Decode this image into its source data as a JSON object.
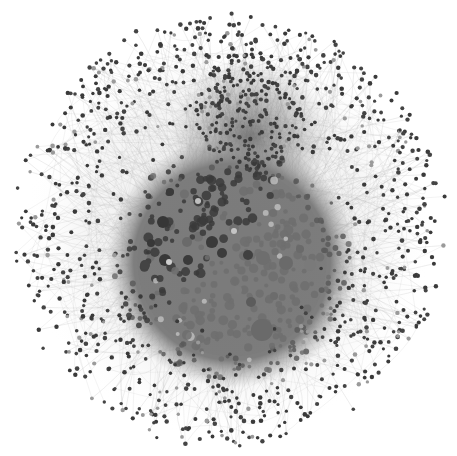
{
  "canvas": {
    "width": 457,
    "height": 456,
    "background": "#ffffff"
  },
  "graph": {
    "type": "force-directed network",
    "center": [
      228,
      230
    ],
    "outer_radius": 215,
    "core": {
      "center": [
        232,
        262
      ],
      "radius": 118,
      "fill": "#7a7a7a"
    },
    "dense_cluster": {
      "center": [
        250,
        110
      ],
      "radius": 55
    },
    "colors": {
      "node_dark": "#3a3a3a",
      "node_mid": "#5a5a5a",
      "node_core": "#6e6e6e",
      "node_light": "#bdbdbd",
      "edge": "#9a9a9a"
    },
    "halo_node_count": 900,
    "core_node_count": 420,
    "large_nodes": [
      {
        "x": 262,
        "y": 330,
        "r": 11,
        "fill": "#6a6a6a"
      },
      {
        "x": 263,
        "y": 258,
        "r": 7,
        "fill": "#6e6e6e"
      },
      {
        "x": 286,
        "y": 263,
        "r": 7,
        "fill": "#6a6a6a"
      },
      {
        "x": 310,
        "y": 265,
        "r": 6,
        "fill": "#7a7a7a"
      },
      {
        "x": 212,
        "y": 242,
        "r": 6,
        "fill": "#3a3a3a"
      },
      {
        "x": 222,
        "y": 253,
        "r": 5,
        "fill": "#3c3c3c"
      },
      {
        "x": 163,
        "y": 222,
        "r": 6,
        "fill": "#363636"
      },
      {
        "x": 165,
        "y": 260,
        "r": 6,
        "fill": "#383838"
      },
      {
        "x": 188,
        "y": 260,
        "r": 5,
        "fill": "#3a3a3a"
      },
      {
        "x": 248,
        "y": 255,
        "r": 5,
        "fill": "#404040"
      },
      {
        "x": 251,
        "y": 302,
        "r": 5,
        "fill": "#5c5c5c"
      },
      {
        "x": 187,
        "y": 242,
        "r": 5,
        "fill": "#6a6a6a"
      },
      {
        "x": 274,
        "y": 296,
        "r": 4,
        "fill": "#6c6c6c"
      },
      {
        "x": 238,
        "y": 290,
        "r": 4,
        "fill": "#7c7c7c"
      },
      {
        "x": 300,
        "y": 249,
        "r": 4,
        "fill": "#6a6a6a"
      },
      {
        "x": 145,
        "y": 265,
        "r": 5,
        "fill": "#444444"
      },
      {
        "x": 151,
        "y": 243,
        "r": 4,
        "fill": "#383838"
      },
      {
        "x": 170,
        "y": 192,
        "r": 4,
        "fill": "#3a3a3a"
      },
      {
        "x": 198,
        "y": 201,
        "r": 3,
        "fill": "#bfbfbf"
      },
      {
        "x": 234,
        "y": 231,
        "r": 3,
        "fill": "#c4c4c4"
      },
      {
        "x": 169,
        "y": 262,
        "r": 3,
        "fill": "#cfcfcf"
      }
    ]
  }
}
